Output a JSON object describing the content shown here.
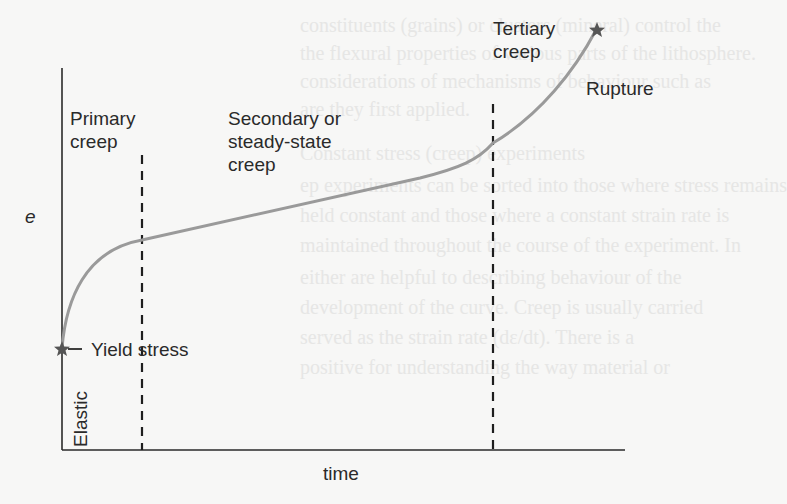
{
  "figure": {
    "type": "creep curve diagram",
    "axes": {
      "y_label": "e",
      "x_label": "time"
    },
    "regions": [
      {
        "id": "primary",
        "label_line1": "Primary",
        "label_line2": "creep"
      },
      {
        "id": "secondary",
        "label_line1": "Secondary or",
        "label_line2": "steady-state",
        "label_line3": "creep"
      },
      {
        "id": "tertiary",
        "label_line1": "Tertiary",
        "label_line2": "creep"
      }
    ],
    "annotations": {
      "yield": "Yield stress",
      "elastic": "Elastic",
      "rupture": "Rupture"
    },
    "markers": [
      {
        "name": "yield-point",
        "shape": "star"
      },
      {
        "name": "rupture-point",
        "shape": "star"
      }
    ],
    "colors": {
      "curve": "#9a9a9a",
      "axes": "#2a2a2a",
      "dashed": "#1e1e1e",
      "star": "#555555",
      "background": "#f7f7f6"
    }
  },
  "background_text": [
    "constituents (grains) or clusters (mineral) control the",
    "the flexural properties of various parts of the lithosphere.",
    "considerations of mechanisms of behaviour such as",
    "are they first applied.",
    "Constant stress (creep) experiments",
    "ep experiments can be sorted into those where stress remains",
    "held constant and those where a constant strain rate is",
    "maintained throughout the course of the experiment. In",
    "either are helpful to describing behaviour of the",
    "development of the curve. Creep is usually carried",
    "served as the strain rate (dε/dt). There is a",
    "positive for understanding the way material or"
  ]
}
